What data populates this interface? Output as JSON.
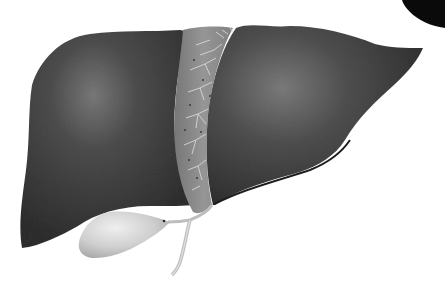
{
  "image": {
    "subject": "Liver with cross-section and gallbladder",
    "style": "grayscale medical illustration",
    "width": 445,
    "height": 295
  },
  "elements": {
    "liver": {
      "label": "Liver",
      "fill_dark": "#3a3a3a",
      "fill_mid": "#555555",
      "highlight": "#8a8a8a"
    },
    "cross_section": {
      "label": "Liver cross-section showing vessels",
      "fill": "#8c8c8c",
      "vessel_color": "#d8d8d8"
    },
    "gallbladder": {
      "label": "Gallbladder",
      "fill": "#cfcfcf",
      "highlight": "#ececec"
    },
    "bile_duct": {
      "label": "Bile duct",
      "stroke": "#bdbdbd"
    },
    "corner_glyph": {
      "label": "Partial black curved shape (cropped letter)",
      "fill": "#0a0a0a"
    }
  }
}
